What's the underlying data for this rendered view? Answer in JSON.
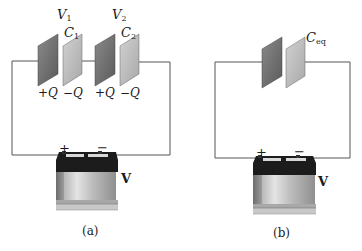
{
  "diagram_a": {
    "caption": "(a)",
    "voltage_labels": [
      {
        "sym": "V",
        "sub": "1"
      },
      {
        "sym": "V",
        "sub": "2"
      }
    ],
    "capacitor_labels": [
      {
        "sym": "C",
        "sub": "1"
      },
      {
        "sym": "C",
        "sub": "2"
      }
    ],
    "charge_labels": [
      "+Q",
      "−Q",
      "+Q",
      "−Q"
    ],
    "battery": {
      "label": "V",
      "positive": "+",
      "negative": "−"
    }
  },
  "diagram_b": {
    "caption": "(b)",
    "capacitor_label": {
      "sym": "C",
      "sub": "eq"
    },
    "battery": {
      "label": "V",
      "positive": "+",
      "negative": "−"
    }
  },
  "colors": {
    "plate_dark": "#6e6e6e",
    "plate_light": "#bdbdbd",
    "wire": "#555555",
    "battery_top": "#1c1c1c",
    "battery_body": "#cfcfcf"
  }
}
